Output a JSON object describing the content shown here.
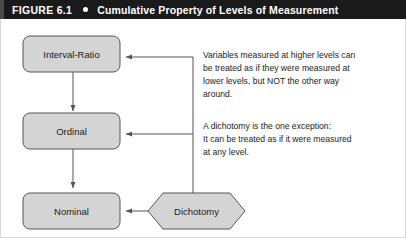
{
  "header": {
    "figure_label": "FIGURE 6.1",
    "bullet": "dot-icon",
    "title": "Cumulative Property of Levels of Measurement",
    "background_color": "#1a1a1a",
    "text_color": "#ffffff"
  },
  "diagram": {
    "node_fill": "#d4d4d4",
    "node_stroke": "#555555",
    "connector_color": "#555555",
    "nodes": [
      {
        "id": "interval-ratio",
        "label": "Interval-Ratio",
        "shape": "rounded-rect"
      },
      {
        "id": "ordinal",
        "label": "Ordinal",
        "shape": "rounded-rect"
      },
      {
        "id": "nominal",
        "label": "Nominal",
        "shape": "rounded-rect"
      },
      {
        "id": "dichotomy",
        "label": "Dichotomy",
        "shape": "hexagon"
      }
    ],
    "notes": [
      {
        "id": "note-cumulative",
        "lines": [
          "Variables measured at higher levels can",
          "be treated as if they were measured at",
          "lower levels, but NOT the other way",
          "around."
        ]
      },
      {
        "id": "note-dichotomy",
        "lines": [
          "A dichotomy is the one exception:",
          "It can be treated as if it were measured",
          "at any level."
        ]
      }
    ]
  }
}
